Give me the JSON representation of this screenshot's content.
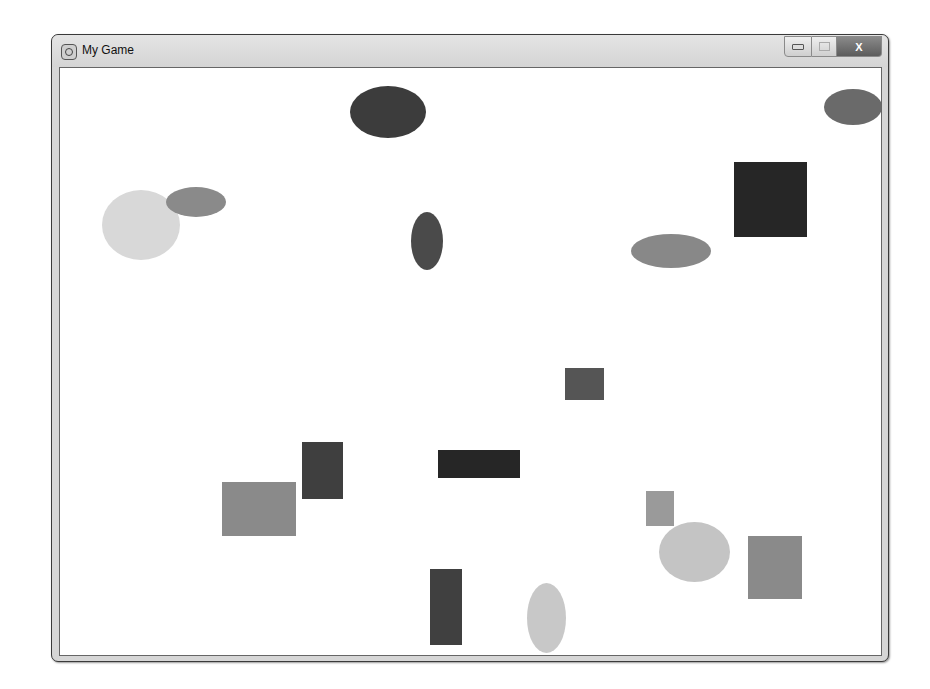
{
  "window": {
    "title": "My Game",
    "icon": "pygame-snake-icon",
    "controls": {
      "minimize": "minimize",
      "maximize": "maximize",
      "close": "X"
    }
  },
  "canvas": {
    "background": "#ffffff",
    "shapes": [
      {
        "type": "ellipse",
        "x": 290,
        "y": 18,
        "w": 76,
        "h": 52,
        "color": "#3c3c3c"
      },
      {
        "type": "ellipse",
        "x": 764,
        "y": 21,
        "w": 58,
        "h": 36,
        "color": "#6a6a6a"
      },
      {
        "type": "ellipse",
        "x": 42,
        "y": 122,
        "w": 78,
        "h": 70,
        "color": "#d8d8d8"
      },
      {
        "type": "ellipse",
        "x": 106,
        "y": 119,
        "w": 60,
        "h": 30,
        "color": "#8a8a8a"
      },
      {
        "type": "ellipse",
        "x": 351,
        "y": 144,
        "w": 32,
        "h": 58,
        "color": "#4a4a4a"
      },
      {
        "type": "ellipse",
        "x": 571,
        "y": 166,
        "w": 80,
        "h": 34,
        "color": "#888888"
      },
      {
        "type": "rect",
        "x": 674,
        "y": 94,
        "w": 73,
        "h": 75,
        "color": "#262626"
      },
      {
        "type": "rect",
        "x": 505,
        "y": 300,
        "w": 39,
        "h": 32,
        "color": "#555555"
      },
      {
        "type": "rect",
        "x": 242,
        "y": 374,
        "w": 41,
        "h": 57,
        "color": "#3f3f3f"
      },
      {
        "type": "rect",
        "x": 378,
        "y": 382,
        "w": 82,
        "h": 28,
        "color": "#262626"
      },
      {
        "type": "rect",
        "x": 162,
        "y": 414,
        "w": 74,
        "h": 54,
        "color": "#8a8a8a"
      },
      {
        "type": "rect",
        "x": 586,
        "y": 423,
        "w": 28,
        "h": 35,
        "color": "#9a9a9a"
      },
      {
        "type": "ellipse",
        "x": 599,
        "y": 454,
        "w": 71,
        "h": 60,
        "color": "#c4c4c4"
      },
      {
        "type": "rect",
        "x": 688,
        "y": 468,
        "w": 54,
        "h": 63,
        "color": "#8a8a8a"
      },
      {
        "type": "rect",
        "x": 370,
        "y": 501,
        "w": 32,
        "h": 76,
        "color": "#404040"
      },
      {
        "type": "ellipse",
        "x": 467,
        "y": 515,
        "w": 39,
        "h": 70,
        "color": "#c8c8c8"
      }
    ]
  }
}
